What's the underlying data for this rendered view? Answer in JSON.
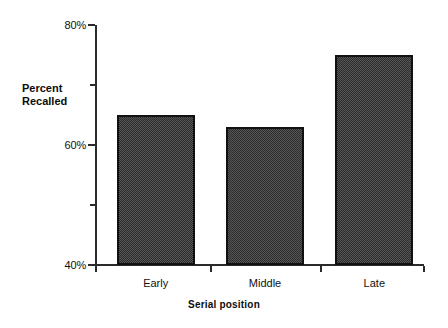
{
  "chart_data": {
    "type": "bar",
    "title": "",
    "subtitle": "",
    "xlabel": "Serial position",
    "ylabel_line1": "Percent",
    "ylabel_line2": "Recalled",
    "categories": [
      "Early",
      "Middle",
      "Late"
    ],
    "values": [
      65,
      63,
      75
    ],
    "ylim": [
      40,
      80
    ],
    "ytick_labels": [
      "80%",
      "60%",
      "40%"
    ],
    "ytick_values": [
      80,
      60,
      40
    ],
    "yminor_tick_values": [
      70,
      50
    ],
    "grid": false,
    "legend": null,
    "bar_fill_color": "#4a4a4a",
    "bar_border_color": "#111111",
    "axis_color": "#2b2b2b",
    "background_color": "#ffffff"
  },
  "axis": {
    "y_title_line1": "Percent",
    "y_title_line2": "Recalled",
    "x_title": "Serial position"
  }
}
